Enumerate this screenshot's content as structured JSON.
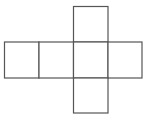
{
  "diagram": {
    "type": "cube-net",
    "stroke_color": "#555555",
    "fill_color": "#ffffff",
    "background": "#ffffff",
    "faces": [
      {
        "id": "top",
        "x": 73.5,
        "y": 6.5,
        "w": 34.5,
        "h": 35.5
      },
      {
        "id": "row-1",
        "x": 4.5,
        "y": 42,
        "w": 34.5,
        "h": 36
      },
      {
        "id": "row-2",
        "x": 39,
        "y": 42,
        "w": 34.5,
        "h": 36
      },
      {
        "id": "row-3",
        "x": 73.5,
        "y": 42,
        "w": 34.5,
        "h": 36
      },
      {
        "id": "row-4",
        "x": 108,
        "y": 42,
        "w": 34,
        "h": 36
      },
      {
        "id": "bottom",
        "x": 73.5,
        "y": 78,
        "w": 34.5,
        "h": 35
      }
    ]
  }
}
